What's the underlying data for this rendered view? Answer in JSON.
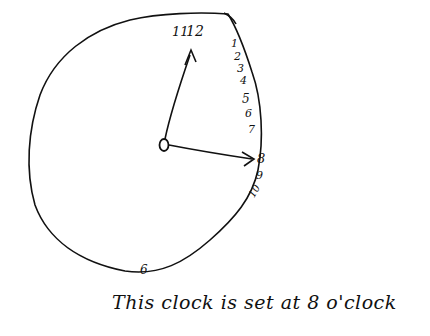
{
  "clock": {
    "numerals": {
      "n11": "11",
      "n12": "12",
      "n1": "1",
      "n2": "2",
      "n3": "3",
      "n4": "4",
      "n5": "5",
      "n6_side": "6",
      "n7": "7",
      "n8": "8",
      "n9": "9",
      "n10": "10",
      "n6_bottom": "6"
    },
    "hands": [
      {
        "name": "minute-hand",
        "points_to": "12"
      },
      {
        "name": "hour-hand",
        "points_to": "8"
      }
    ],
    "ink_color": "#111111"
  },
  "caption": "This clock is set at 8 o'clock"
}
